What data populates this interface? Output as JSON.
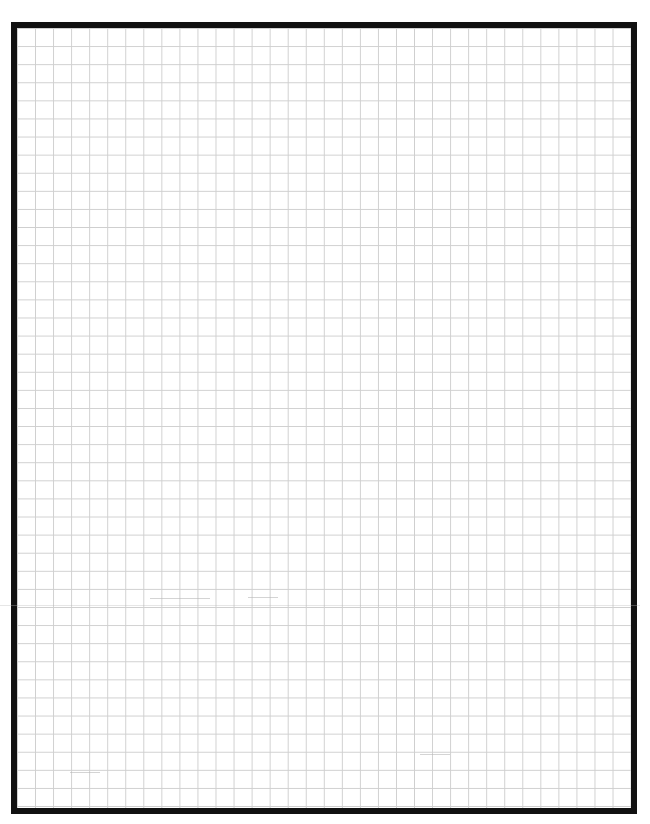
{
  "page": {
    "type": "graph-paper",
    "border_color": "#111111",
    "grid_color": "#cfcfcf",
    "background_color": "#ffffff",
    "columns": 34,
    "rows": 43
  }
}
